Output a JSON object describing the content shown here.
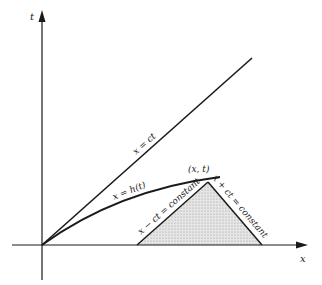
{
  "diagram": {
    "axes": {
      "t_label": "t",
      "x_label": "x"
    },
    "lines": {
      "light_line_label": "x = ct",
      "boundary_curve_label": "x = h(t)",
      "left_characteristic_label": "x − ct = constant",
      "right_characteristic_label": "x + ct = constant"
    },
    "point_label": "(x, t)",
    "colors": {
      "ink": "#1a1a1a",
      "shading": "#d8d8d8",
      "background": "#ffffff"
    }
  }
}
